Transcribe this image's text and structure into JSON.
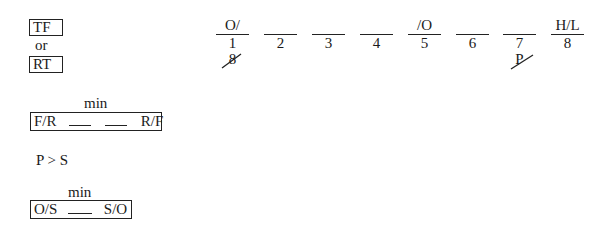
{
  "left_panel": {
    "tf_box": "TF",
    "or_text": "or",
    "rt_box": "RT",
    "fr_rule": {
      "label_above": "min",
      "left": "F/R",
      "blanks": 2,
      "right": "R/F"
    },
    "priority_rule": "P > S",
    "os_rule": {
      "label_above": "min",
      "left": "O/S",
      "blanks": 1,
      "right": "S/O"
    }
  },
  "slots": [
    {
      "position": "1",
      "above": "O/",
      "struck_below": "8"
    },
    {
      "position": "2",
      "above": "",
      "struck_below": ""
    },
    {
      "position": "3",
      "above": "",
      "struck_below": ""
    },
    {
      "position": "4",
      "above": "",
      "struck_below": ""
    },
    {
      "position": "5",
      "above": "/O",
      "struck_below": ""
    },
    {
      "position": "6",
      "above": "",
      "struck_below": ""
    },
    {
      "position": "7",
      "above": "",
      "struck_below": "P"
    },
    {
      "position": "8",
      "above": "H/L",
      "struck_below": ""
    }
  ]
}
